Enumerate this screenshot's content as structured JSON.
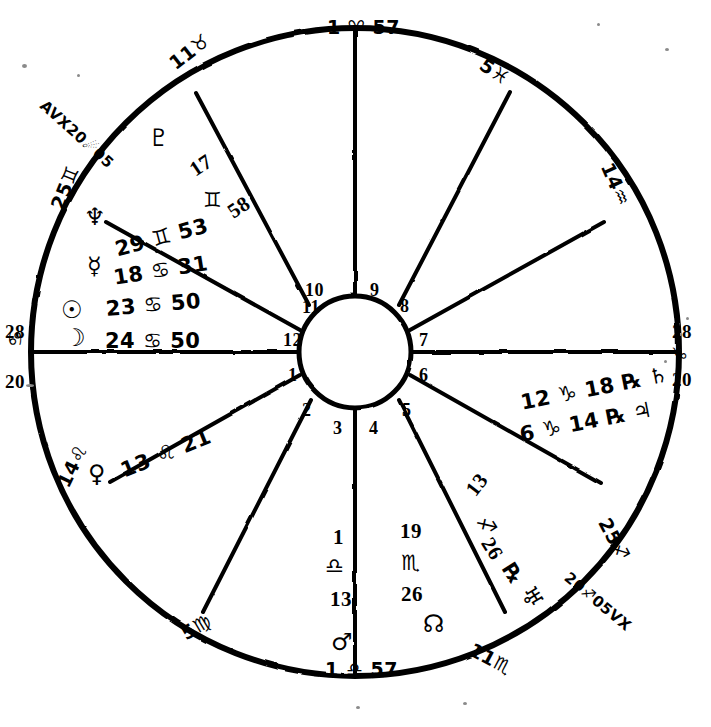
{
  "chart": {
    "type": "astrological-wheel",
    "houses_count": 12,
    "colors": {
      "ink": "#000000",
      "paper": "#ffffff"
    }
  },
  "house_numbers": [
    "1",
    "2",
    "3",
    "4",
    "5",
    "6",
    "7",
    "8",
    "9",
    "10",
    "11",
    "12"
  ],
  "cusps": {
    "asc_label": "AVX20☄05",
    "mc_top": "1 ♈ 57",
    "ic_bottom": "1 ♎ 57",
    "left_28": "28",
    "left_sign": "♋",
    "left_20": "20",
    "right_28": "28",
    "right_sign": "♑",
    "right_20": "20",
    "taurus_11": "11♉",
    "gemini_25": "25♊",
    "pisces_5": "5♓",
    "aquarius_14": "14♒",
    "leo_14": "14♌",
    "virgo_5": "5♍",
    "scorpio_11": "11♏",
    "sagittarius_25": "25♐",
    "vertex_label": "20♐05VX"
  },
  "planets": [
    {
      "name": "pluto",
      "glyph": "♇",
      "degree": "17",
      "sign": "♊",
      "minute": "58",
      "retrograde": ""
    },
    {
      "name": "neptune",
      "glyph": "♆",
      "degree": "29",
      "sign": "♊",
      "minute": "53",
      "retrograde": ""
    },
    {
      "name": "mercury",
      "glyph": "☿",
      "degree": "18",
      "sign": "♋",
      "minute": "31",
      "retrograde": ""
    },
    {
      "name": "sun",
      "glyph": "☉",
      "degree": "23",
      "sign": "♋",
      "minute": "50",
      "retrograde": ""
    },
    {
      "name": "moon",
      "glyph": "☽",
      "degree": "24",
      "sign": "♋",
      "minute": "50",
      "retrograde": ""
    },
    {
      "name": "venus",
      "glyph": "♀",
      "degree": "13",
      "sign": "♌",
      "minute": "21",
      "retrograde": ""
    },
    {
      "name": "saturn",
      "glyph": "♄",
      "degree": "12",
      "sign": "♑",
      "minute": "18",
      "retrograde": "℞"
    },
    {
      "name": "jupiter",
      "glyph": "♃",
      "degree": "6",
      "sign": "♑",
      "minute": "14",
      "retrograde": "℞"
    },
    {
      "name": "uranus",
      "glyph": "♅",
      "degree": "13",
      "sign": "♐",
      "minute": "26",
      "retrograde": "℞"
    },
    {
      "name": "mars",
      "glyph": "♂",
      "degree": "",
      "sign": "",
      "minute": "",
      "retrograde": ""
    },
    {
      "name": "north-node",
      "glyph": "☊",
      "degree": "",
      "sign": "",
      "minute": "",
      "retrograde": ""
    }
  ],
  "inner_labels": {
    "libra_cusp_deg": "1",
    "libra_cusp_sign": "♎",
    "libra_cusp_min": "13",
    "scorpio_deg": "19",
    "scorpio_sign": "♏",
    "scorpio_min": "26"
  },
  "text_groups": {
    "neptune_line": "29 ♊ 53",
    "mercury_line": "18 ♋ 31",
    "sun_line": "23 ♋ 50",
    "moon_line": "24 ♋ 50",
    "venus_line": "13 ♌ 21",
    "saturn_line": "12 ♑ 18 ℞ ♄",
    "jupiter_line": "6 ♑ 14 ℞ ♃",
    "pluto_deg": "17",
    "pluto_sign": "♊",
    "pluto_min": "58",
    "uranus_deg": "13",
    "uranus_sign": "♐",
    "uranus_min": "26",
    "uranus_rx": "℞",
    "uranus_glyph": "♅"
  }
}
